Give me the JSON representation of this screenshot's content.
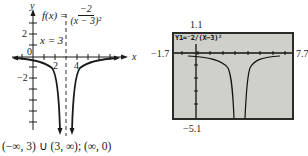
{
  "left_graph": {
    "function_label": "f(x) =",
    "numerator": "−2",
    "denominator": "(x − 3)²",
    "asymptote_label": "x = 3",
    "y_axis_label": "y",
    "x_axis_label": "x",
    "y_ticks": [
      "2",
      "−2"
    ],
    "x_ticks": [
      "2",
      "4"
    ],
    "origin_label": "0",
    "domain_range_text": "(−∞, 3) ∪ (3, ∞); (∞, 0)"
  },
  "calculator": {
    "equation": "Y1=⁻2/(X−3)²",
    "window_ymax": "1.1",
    "window_ymin": "−5.1",
    "window_xmin": "−1.7",
    "window_xmax": "7.7",
    "screen_color": "#cfd0c9"
  }
}
